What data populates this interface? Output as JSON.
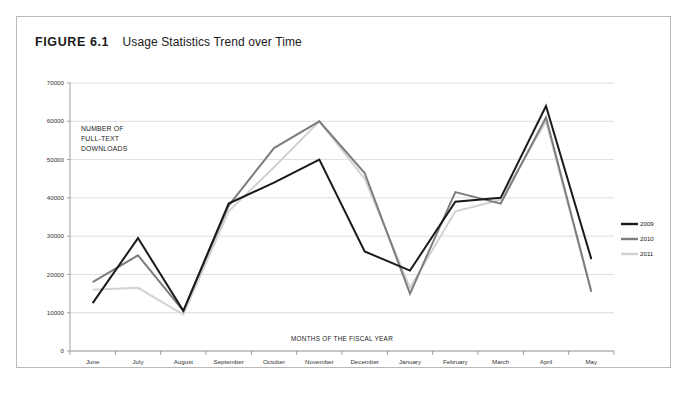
{
  "figure": {
    "label": "FIGURE 6.1",
    "caption": "Usage Statistics Trend over Time"
  },
  "chart_data": {
    "type": "line",
    "title": "Usage Statistics Trend over Time",
    "xlabel": "MONTHS OF THE FISCAL YEAR",
    "ylabel": "NUMBER OF FULL-TEXT DOWNLOADS",
    "ylabel_lines": [
      "NUMBER OF",
      "FULL-TEXT",
      "DOWNLOADS"
    ],
    "categories": [
      "June",
      "July",
      "August",
      "September",
      "October",
      "November",
      "December",
      "January",
      "February",
      "March",
      "April",
      "May"
    ],
    "series": [
      {
        "name": "2009",
        "color": "#1a1a1a",
        "values": [
          12500,
          29500,
          10500,
          38500,
          44000,
          50000,
          26000,
          21000,
          39000,
          40000,
          64000,
          24000
        ]
      },
      {
        "name": "2010",
        "color": "#7d7d7d",
        "values": [
          18000,
          25000,
          10500,
          38000,
          53000,
          60000,
          46500,
          15000,
          41500,
          38500,
          61000,
          15500
        ]
      },
      {
        "name": "2011",
        "color": "#d2d2d2",
        "values": [
          16000,
          16500,
          9500,
          36500,
          48000,
          60000,
          45000,
          16500,
          36500,
          39500,
          60000,
          15500
        ]
      }
    ],
    "ylim": [
      0,
      70000
    ],
    "yticks": [
      0,
      10000,
      20000,
      30000,
      40000,
      50000,
      60000,
      70000
    ],
    "ytick_labels": [
      "0",
      "10000",
      "20000",
      "30000",
      "40000",
      "50000",
      "60000",
      "70000"
    ],
    "grid": true,
    "legend_position": "right",
    "legend_entries": [
      "2009",
      "2010",
      "2011"
    ]
  },
  "colors": {
    "series_2009": "#1a1a1a",
    "series_2010": "#7d7d7d",
    "series_2011": "#d2d2d2",
    "gridline": "#cfcfcf",
    "border": "#b9b9b9"
  }
}
